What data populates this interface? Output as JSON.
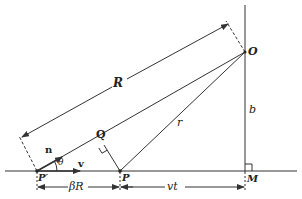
{
  "diagram": {
    "labels": {
      "R": "R",
      "O": "O",
      "Q": "Q",
      "r": "r",
      "b": "b",
      "n": "n",
      "theta": "θ",
      "v": "v",
      "P_prime": "P′",
      "P": "P",
      "M": "M",
      "beta_R": "βR",
      "vt": "vt"
    },
    "points": {
      "O": [
        245,
        52
      ],
      "P_prime": [
        37,
        171
      ],
      "P": [
        120,
        171
      ],
      "M": [
        245,
        171
      ],
      "Q": [
        104,
        145
      ]
    },
    "colors": {
      "line": "#333333",
      "text": "#222222",
      "background": "#ffffff"
    }
  }
}
